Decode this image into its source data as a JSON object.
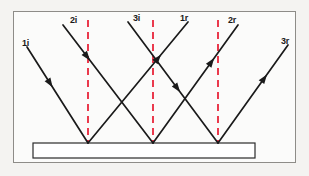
{
  "figure": {
    "background_color": "#f4f3f1",
    "frame_color": "#8e8c88",
    "ray_color": "#1a1a1a",
    "normal_color": "#e8253a",
    "mirror_fill": "#ffffff",
    "mirror_border": "#2b2b2b"
  },
  "mirror": {
    "name": "plane-mirror",
    "x": 33,
    "y": 143,
    "width": 222,
    "height": 15
  },
  "normals": [
    {
      "label": "",
      "x": 88,
      "y_top": 20,
      "y_bottom": 145
    },
    {
      "label": "",
      "x": 153,
      "y_top": 20,
      "y_bottom": 145
    },
    {
      "label": "",
      "x": 218,
      "y_top": 20,
      "y_bottom": 145
    }
  ],
  "incidence_points": [
    {
      "id": "P1",
      "x": 88,
      "y": 143
    },
    {
      "id": "P2",
      "x": 153,
      "y": 143
    },
    {
      "id": "P3",
      "x": 218,
      "y": 143
    }
  ],
  "rays": [
    {
      "id": "1i",
      "label": "1i",
      "kind": "incident",
      "x1": 27,
      "y1": 47,
      "x2": 88,
      "y2": 143,
      "arrow_t": 0.42,
      "label_x": 22,
      "label_y": 39
    },
    {
      "id": "2i",
      "label": "2i",
      "kind": "incident",
      "x1": 63,
      "y1": 25,
      "x2": 153,
      "y2": 143,
      "arrow_t": 0.3,
      "label_x": 70,
      "label_y": 16
    },
    {
      "id": "3i",
      "label": "3i",
      "kind": "incident",
      "x1": 128,
      "y1": 22,
      "x2": 218,
      "y2": 143,
      "arrow_t": 0.58,
      "label_x": 133,
      "label_y": 14
    },
    {
      "id": "1r",
      "label": "1r",
      "kind": "reflected",
      "x1": 88,
      "y1": 143,
      "x2": 188,
      "y2": 22,
      "arrow_t": 0.73,
      "label_x": 180,
      "label_y": 14
    },
    {
      "id": "2r",
      "label": "2r",
      "kind": "reflected",
      "x1": 153,
      "y1": 143,
      "x2": 238,
      "y2": 25,
      "arrow_t": 0.72,
      "label_x": 228,
      "label_y": 16
    },
    {
      "id": "3r",
      "label": "3r",
      "kind": "reflected",
      "x1": 218,
      "y1": 143,
      "x2": 288,
      "y2": 45,
      "arrow_t": 0.7,
      "label_x": 281,
      "label_y": 37
    }
  ]
}
